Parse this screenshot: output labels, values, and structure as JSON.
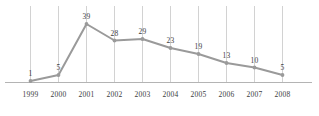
{
  "chart_data": {
    "type": "line",
    "title": "",
    "subtitle": "",
    "xlabel": "",
    "ylabel": "",
    "categories": [
      "1999",
      "2000",
      "2001",
      "2002",
      "2003",
      "2004",
      "2005",
      "2006",
      "2007",
      "2008"
    ],
    "values": [
      1,
      5,
      39,
      28,
      29,
      23,
      19,
      13,
      10,
      5
    ],
    "value_labels": [
      "1",
      "5",
      "39",
      "28",
      "29",
      "23",
      "19",
      "13",
      "10",
      "5"
    ],
    "series": [
      {
        "name": "",
        "values": [
          1,
          5,
          39,
          28,
          29,
          23,
          19,
          13,
          10,
          5
        ]
      }
    ],
    "ylim": [
      0,
      39
    ],
    "xlim": [
      "1999",
      "2008"
    ],
    "grid": {
      "vertical": true,
      "horizontal": false
    },
    "legend": {
      "visible": false,
      "position": "none"
    },
    "markers": true,
    "data_labels": true,
    "colors": {
      "line": "#9a9a9a",
      "marker": "#9a9a9a",
      "gridline": "#d2d2d2",
      "axis": "#b4b4b4",
      "text": "#3c3c3c",
      "background": "#ffffff"
    }
  }
}
